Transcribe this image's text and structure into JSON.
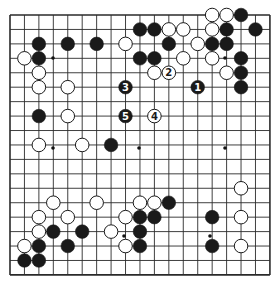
{
  "board": {
    "size": 19,
    "origin_x": 10,
    "origin_y": 15,
    "spacing": 14.44,
    "line_color": "#2a2a2a",
    "background": "#ffffff",
    "star_points_px": [
      [
        53,
        58
      ],
      [
        225,
        58
      ],
      [
        53,
        148
      ],
      [
        139,
        148
      ],
      [
        225,
        148
      ],
      [
        124,
        236
      ],
      [
        210,
        236
      ]
    ]
  },
  "stones": [
    {
      "c": 14,
      "r": 0,
      "color": "white"
    },
    {
      "c": 15,
      "r": 0,
      "color": "white"
    },
    {
      "c": 16,
      "r": 0,
      "color": "black"
    },
    {
      "c": 9,
      "r": 1,
      "color": "black"
    },
    {
      "c": 10,
      "r": 1,
      "color": "black"
    },
    {
      "c": 11,
      "r": 1,
      "color": "white"
    },
    {
      "c": 12,
      "r": 1,
      "color": "white"
    },
    {
      "c": 14,
      "r": 1,
      "color": "white"
    },
    {
      "c": 15,
      "r": 1,
      "color": "black"
    },
    {
      "c": 17,
      "r": 1,
      "color": "black"
    },
    {
      "c": 2,
      "r": 2,
      "color": "black"
    },
    {
      "c": 4,
      "r": 2,
      "color": "black"
    },
    {
      "c": 6,
      "r": 2,
      "color": "black"
    },
    {
      "c": 8,
      "r": 2,
      "color": "white"
    },
    {
      "c": 11,
      "r": 2,
      "color": "black"
    },
    {
      "c": 13,
      "r": 2,
      "color": "white"
    },
    {
      "c": 14,
      "r": 2,
      "color": "black"
    },
    {
      "c": 15,
      "r": 2,
      "color": "black"
    },
    {
      "c": 1,
      "r": 3,
      "color": "white"
    },
    {
      "c": 2,
      "r": 3,
      "color": "black"
    },
    {
      "c": 9,
      "r": 3,
      "color": "black"
    },
    {
      "c": 10,
      "r": 3,
      "color": "black"
    },
    {
      "c": 12,
      "r": 3,
      "color": "white"
    },
    {
      "c": 14,
      "r": 3,
      "color": "white"
    },
    {
      "c": 16,
      "r": 3,
      "color": "black"
    },
    {
      "c": 2,
      "r": 4,
      "color": "white"
    },
    {
      "c": 10,
      "r": 4,
      "color": "white"
    },
    {
      "c": 11,
      "r": 4,
      "color": "white",
      "label": "2"
    },
    {
      "c": 15,
      "r": 4,
      "color": "white"
    },
    {
      "c": 16,
      "r": 4,
      "color": "black"
    },
    {
      "c": 2,
      "r": 5,
      "color": "white"
    },
    {
      "c": 4,
      "r": 5,
      "color": "white"
    },
    {
      "c": 8,
      "r": 5,
      "color": "black",
      "label": "3"
    },
    {
      "c": 13,
      "r": 5,
      "color": "black",
      "label": "1"
    },
    {
      "c": 16,
      "r": 5,
      "color": "black"
    },
    {
      "c": 2,
      "r": 7,
      "color": "black"
    },
    {
      "c": 4,
      "r": 7,
      "color": "white"
    },
    {
      "c": 8,
      "r": 7,
      "color": "black",
      "label": "5"
    },
    {
      "c": 10,
      "r": 7,
      "color": "white",
      "label": "4"
    },
    {
      "c": 2,
      "r": 9,
      "color": "white"
    },
    {
      "c": 5,
      "r": 9,
      "color": "white"
    },
    {
      "c": 7,
      "r": 9,
      "color": "black"
    },
    {
      "c": 16,
      "r": 12,
      "color": "white"
    },
    {
      "c": 3,
      "r": 13,
      "color": "white"
    },
    {
      "c": 6,
      "r": 13,
      "color": "white"
    },
    {
      "c": 9,
      "r": 13,
      "color": "white"
    },
    {
      "c": 10,
      "r": 13,
      "color": "white"
    },
    {
      "c": 11,
      "r": 13,
      "color": "black"
    },
    {
      "c": 2,
      "r": 14,
      "color": "white"
    },
    {
      "c": 4,
      "r": 14,
      "color": "white"
    },
    {
      "c": 8,
      "r": 14,
      "color": "white"
    },
    {
      "c": 9,
      "r": 14,
      "color": "black"
    },
    {
      "c": 10,
      "r": 14,
      "color": "black"
    },
    {
      "c": 14,
      "r": 14,
      "color": "black"
    },
    {
      "c": 16,
      "r": 14,
      "color": "white"
    },
    {
      "c": 2,
      "r": 15,
      "color": "white"
    },
    {
      "c": 3,
      "r": 15,
      "color": "black"
    },
    {
      "c": 5,
      "r": 15,
      "color": "black"
    },
    {
      "c": 7,
      "r": 15,
      "color": "white"
    },
    {
      "c": 9,
      "r": 15,
      "color": "black"
    },
    {
      "c": 1,
      "r": 16,
      "color": "white"
    },
    {
      "c": 2,
      "r": 16,
      "color": "black"
    },
    {
      "c": 4,
      "r": 16,
      "color": "black"
    },
    {
      "c": 8,
      "r": 16,
      "color": "white"
    },
    {
      "c": 9,
      "r": 16,
      "color": "black"
    },
    {
      "c": 14,
      "r": 16,
      "color": "black"
    },
    {
      "c": 16,
      "r": 16,
      "color": "white"
    },
    {
      "c": 1,
      "r": 17,
      "color": "black"
    },
    {
      "c": 2,
      "r": 17,
      "color": "black"
    }
  ]
}
